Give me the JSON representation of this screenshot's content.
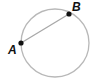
{
  "diagram": {
    "circle": {
      "cx": 55,
      "cy": 43,
      "r": 34,
      "stroke": "#b8b8b8"
    },
    "chord": {
      "from": "A",
      "to": "B",
      "stroke": "#a8a8a8"
    },
    "points": [
      {
        "label": "A",
        "x": 21,
        "y": 43,
        "label_x": 8,
        "label_y": 54
      },
      {
        "label": "B",
        "x": 69,
        "y": 14,
        "label_x": 72,
        "label_y": 11
      }
    ],
    "point_color": "#111111"
  }
}
